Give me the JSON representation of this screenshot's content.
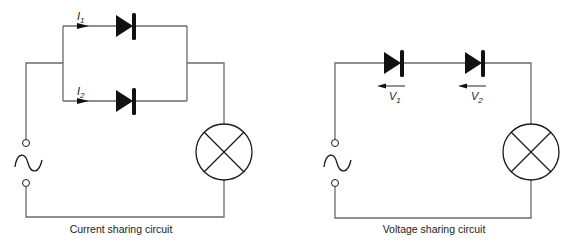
{
  "diagrams": [
    {
      "name": "current-sharing",
      "caption": "Current sharing circuit",
      "labels": {
        "i1": "I",
        "i1_sub": "1",
        "i2": "I",
        "i2_sub": "2"
      }
    },
    {
      "name": "voltage-sharing",
      "caption": "Voltage sharing circuit",
      "labels": {
        "v1": "V",
        "v1_sub": "1",
        "v2": "V",
        "v2_sub": "2"
      }
    }
  ],
  "colors": {
    "wire": "#6b6b6b",
    "component": "#1a1a1a",
    "background": "#ffffff"
  }
}
